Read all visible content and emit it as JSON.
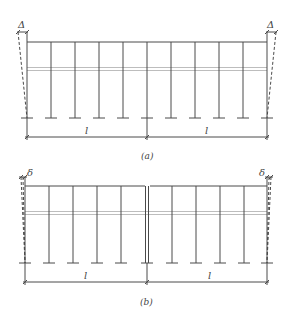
{
  "figure": {
    "colors": {
      "line": "#4a4a4a",
      "gray_beam": "#b8b8b8",
      "dashed": "#4a4a4a",
      "background": "#ffffff"
    },
    "panels": [
      {
        "id": "a",
        "caption": "(a)",
        "span_labels": [
          "l",
          "l"
        ],
        "drift_label": "Δ",
        "columns_per_span": 5,
        "spans": 2,
        "center_joint": "single"
      },
      {
        "id": "b",
        "caption": "(b)",
        "span_labels": [
          "l",
          "l"
        ],
        "drift_label": "δ",
        "columns_per_span": 5,
        "spans": 2,
        "center_joint": "double (expansion joint)"
      }
    ]
  }
}
